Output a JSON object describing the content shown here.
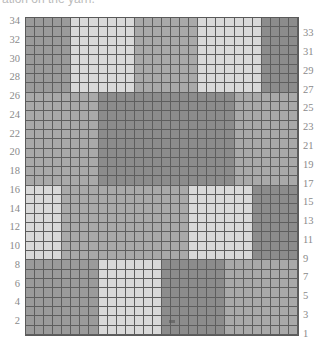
{
  "caption": "ation on the yarn.",
  "chart": {
    "rows": 34,
    "cols": 30,
    "colors": {
      "L": "#d9d9d9",
      "M": "#a9a9a9",
      "N": "#9b9b9b",
      "D": "#8c8c8c"
    },
    "bands": [
      {
        "rows": [
          27,
          34
        ],
        "segments": [
          [
            "N",
            5
          ],
          [
            "L",
            7
          ],
          [
            "M",
            7
          ],
          [
            "L",
            7
          ],
          [
            "D",
            4
          ]
        ]
      },
      {
        "rows": [
          17,
          26
        ],
        "segments": [
          [
            "M",
            8
          ],
          [
            "D",
            15
          ],
          [
            "M",
            7
          ]
        ]
      },
      {
        "rows": [
          9,
          16
        ],
        "segments": [
          [
            "L",
            4
          ],
          [
            "M",
            14
          ],
          [
            "L",
            7
          ],
          [
            "D",
            5
          ]
        ]
      },
      {
        "rows": [
          1,
          8
        ],
        "segments": [
          [
            "N",
            8
          ],
          [
            "L",
            7
          ],
          [
            "D",
            7
          ],
          [
            "M",
            8
          ]
        ]
      }
    ],
    "left_labels": [
      "34",
      "32",
      "30",
      "28",
      "26",
      "24",
      "22",
      "20",
      "18",
      "16",
      "14",
      "12",
      "10",
      "8",
      "6",
      "4",
      "2"
    ],
    "right_labels": [
      "33",
      "31",
      "29",
      "27",
      "25",
      "23",
      "21",
      "19",
      "17",
      "15",
      "13",
      "11",
      "9",
      "7",
      "5",
      "3",
      "1"
    ]
  }
}
